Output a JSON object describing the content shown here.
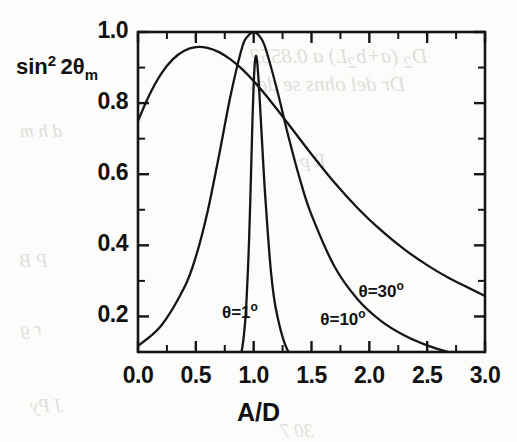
{
  "figure": {
    "y_axis_title_parts": {
      "base": "sin",
      "exponent": "2",
      "arg": "2θ",
      "sub": "m"
    },
    "x_axis_title": "A/D"
  },
  "chart_data": {
    "type": "line",
    "title": "",
    "subtitle": "",
    "xlabel": "A/D",
    "ylabel": "sin² 2θₘ",
    "xlim": [
      0.0,
      3.0
    ],
    "ylim": [
      0.1,
      1.0
    ],
    "grid": false,
    "legend_position": "inline-annotations",
    "x_ticks": [
      "0.0",
      "0.5",
      "1.0",
      "1.5",
      "2.0",
      "2.5",
      "3.0"
    ],
    "x_tick_values": [
      0.0,
      0.5,
      1.0,
      1.5,
      2.0,
      2.5,
      3.0
    ],
    "x_minor_tick_values": [
      0.25,
      0.75,
      1.25,
      1.75,
      2.25,
      2.75
    ],
    "y_ticks": [
      "1.0",
      "0.8",
      "0.6",
      "0.4",
      "0.2"
    ],
    "y_tick_values": [
      1.0,
      0.8,
      0.6,
      0.4,
      0.2
    ],
    "y_minor_tick_values": [
      0.9,
      0.7,
      0.5,
      0.3
    ],
    "annotations": [
      {
        "text": "θ=1",
        "sup": "o",
        "x": 1.02,
        "y": 0.215
      },
      {
        "text": "θ=10",
        "sup": "o",
        "x": 1.87,
        "y": 0.195
      },
      {
        "text": "θ=30",
        "sup": "o",
        "x": 2.2,
        "y": 0.275
      }
    ],
    "series": [
      {
        "name": "θ=1°",
        "theta_deg": 1,
        "sin2theta": 0.0349,
        "x": [
          0.0,
          0.2,
          0.4,
          0.6,
          0.7,
          0.8,
          0.85,
          0.9,
          0.93,
          0.95,
          0.96,
          0.97,
          0.98,
          0.99,
          1.0,
          1.01,
          1.02,
          1.03,
          1.04,
          1.05,
          1.07,
          1.1,
          1.15,
          1.2,
          1.3,
          1.5,
          2.0,
          3.0
        ],
        "y": [
          0.0012,
          0.0019,
          0.0034,
          0.0076,
          0.0135,
          0.0303,
          0.0535,
          0.1094,
          0.2002,
          0.3281,
          0.4125,
          0.5174,
          0.6362,
          0.7556,
          0.8523,
          0.9132,
          0.9331,
          0.9163,
          0.876,
          0.823,
          0.7057,
          0.5386,
          0.324,
          0.2081,
          0.1009,
          0.0383,
          0.0086,
          0.0022
        ]
      },
      {
        "name": "θ=10°",
        "theta_deg": 10,
        "sin2theta": 0.342,
        "x": [
          0.0,
          0.2,
          0.4,
          0.5,
          0.6,
          0.7,
          0.8,
          0.9,
          0.95,
          1.0,
          1.05,
          1.1,
          1.2,
          1.3,
          1.4,
          1.5,
          1.7,
          1.9,
          2.1,
          2.3,
          2.5,
          2.7,
          3.0
        ],
        "y": [
          0.117,
          0.1738,
          0.2813,
          0.368,
          0.4926,
          0.6522,
          0.8206,
          0.9564,
          0.9883,
          1.0,
          0.9883,
          0.9564,
          0.8404,
          0.7068,
          0.5858,
          0.4855,
          0.3396,
          0.2476,
          0.1875,
          0.147,
          0.1186,
          0.098,
          0.076
        ]
      },
      {
        "name": "θ=30°",
        "theta_deg": 30,
        "sin2theta": 0.866,
        "x": [
          0.0,
          0.1,
          0.2,
          0.3,
          0.4,
          0.5,
          0.6,
          0.7,
          0.8,
          0.9,
          1.0,
          1.1,
          1.2,
          1.3,
          1.5,
          1.7,
          1.9,
          2.1,
          2.3,
          2.5,
          2.7,
          3.0
        ],
        "y": [
          0.75,
          0.8242,
          0.8824,
          0.9231,
          0.9474,
          0.9574,
          0.9554,
          0.9434,
          0.9231,
          0.8955,
          0.862,
          0.8242,
          0.7834,
          0.7411,
          0.6562,
          0.576,
          0.5045,
          0.4425,
          0.3894,
          0.3443,
          0.3059,
          0.2578
        ]
      }
    ]
  }
}
